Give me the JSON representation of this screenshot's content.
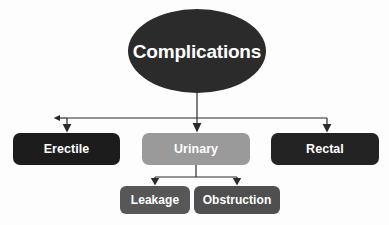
{
  "diagram": {
    "title": "Complications",
    "type": "hierarchy-flowchart",
    "background_color": "#fdfdfd",
    "connector_color": "#2a2a2a",
    "text_color": "#ffffff",
    "levels": 3
  },
  "nodes": {
    "root": {
      "id": "complications",
      "label": "Complications",
      "shape": "ellipse",
      "fill_color": "#2b2b2b",
      "x": 128,
      "y": 9,
      "width": 138,
      "height": 84
    },
    "level2": [
      {
        "id": "erectile",
        "label": "Erectile",
        "shape": "rounded-rect",
        "fill_color": "#1c1c1c",
        "x": 13,
        "y": 133,
        "width": 107,
        "height": 32
      },
      {
        "id": "urinary",
        "label": "Urinary",
        "shape": "rounded-rect",
        "fill_color": "#9a9a9a",
        "x": 142,
        "y": 133,
        "width": 108,
        "height": 32
      },
      {
        "id": "rectal",
        "label": "Rectal",
        "shape": "rounded-rect",
        "fill_color": "#232323",
        "x": 271,
        "y": 133,
        "width": 108,
        "height": 32
      }
    ],
    "level3": [
      {
        "id": "leakage",
        "label": "Leakage",
        "shape": "rounded-rect",
        "fill_color": "#575757",
        "x": 120,
        "y": 186,
        "width": 70,
        "height": 28
      },
      {
        "id": "obstruction",
        "label": "Obstruction",
        "shape": "rounded-rect",
        "fill_color": "#4f4f4f",
        "x": 194,
        "y": 186,
        "width": 86,
        "height": 28
      }
    ]
  },
  "edges": [
    {
      "from": "complications",
      "to": "erectile",
      "arrow": "down"
    },
    {
      "from": "complications",
      "to": "urinary",
      "arrow": "down"
    },
    {
      "from": "complications",
      "to": "rectal",
      "arrow": "down"
    },
    {
      "from": "urinary",
      "to": "leakage",
      "arrow": "down"
    },
    {
      "from": "urinary",
      "to": "obstruction",
      "arrow": "down"
    }
  ]
}
